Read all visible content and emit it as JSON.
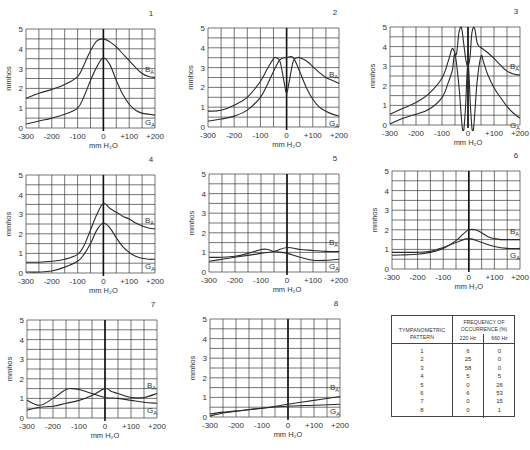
{
  "chart_data": [
    {
      "type": "line",
      "panel": "1",
      "xlabel": "mm H2O",
      "ylabel": "mmhos",
      "xlim": [
        -300,
        200
      ],
      "ylim": [
        0,
        5
      ],
      "xticks": [
        "-300",
        "-200",
        "-100",
        "0",
        "+100",
        "+200"
      ],
      "yticks": [
        "0",
        "1",
        "2",
        "3",
        "4",
        "5"
      ],
      "grid": true,
      "series": [
        {
          "name": "BA",
          "x": [
            -300,
            -250,
            -200,
            -150,
            -100,
            -75,
            -50,
            -25,
            0,
            25,
            50,
            75,
            100,
            125,
            150,
            175,
            200
          ],
          "y": [
            1.5,
            1.75,
            1.95,
            2.2,
            2.6,
            3.2,
            3.9,
            4.4,
            4.5,
            4.35,
            4.1,
            3.75,
            3.4,
            3.05,
            2.75,
            2.6,
            2.55
          ]
        },
        {
          "name": "GA",
          "x": [
            -300,
            -250,
            -200,
            -150,
            -100,
            -75,
            -50,
            -25,
            0,
            25,
            50,
            75,
            100,
            125,
            150,
            175,
            200
          ],
          "y": [
            0.2,
            0.35,
            0.5,
            0.7,
            1.0,
            1.6,
            2.4,
            3.1,
            3.55,
            3.2,
            2.4,
            1.7,
            1.2,
            0.9,
            0.75,
            0.7,
            0.65
          ]
        }
      ]
    },
    {
      "type": "line",
      "panel": "2",
      "xlabel": "mm H2O",
      "ylabel": "mmhos",
      "xlim": [
        -300,
        200
      ],
      "ylim": [
        0,
        5
      ],
      "xticks": [
        "-300",
        "-200",
        "-100",
        "0",
        "+100",
        "+200"
      ],
      "yticks": [
        "0",
        "1",
        "2",
        "3",
        "4",
        "5"
      ],
      "grid": true,
      "series": [
        {
          "name": "BA",
          "x": [
            -300,
            -250,
            -200,
            -150,
            -100,
            -75,
            -50,
            -40,
            -25,
            -10,
            0,
            10,
            25,
            40,
            50,
            75,
            100,
            125,
            150,
            175,
            200
          ],
          "y": [
            0.8,
            0.85,
            1.1,
            1.5,
            2.3,
            2.9,
            3.45,
            3.5,
            3.3,
            2.3,
            1.7,
            2.3,
            3.3,
            3.5,
            3.5,
            3.35,
            3.05,
            2.75,
            2.5,
            2.35,
            2.2
          ]
        },
        {
          "name": "GA",
          "x": [
            -300,
            -250,
            -200,
            -150,
            -100,
            -75,
            -50,
            -25,
            0,
            25,
            50,
            75,
            100,
            125,
            150,
            175,
            200
          ],
          "y": [
            0.3,
            0.4,
            0.55,
            0.85,
            1.5,
            2.1,
            2.8,
            3.4,
            3.5,
            3.5,
            2.8,
            2.0,
            1.4,
            1.0,
            0.8,
            0.65,
            0.55
          ]
        }
      ]
    },
    {
      "type": "line",
      "panel": "3",
      "xlabel": "mm H2O",
      "ylabel": "mmhos",
      "xlim": [
        -300,
        200
      ],
      "ylim": [
        0,
        5
      ],
      "xticks": [
        "-300",
        "-200",
        "-100",
        "0",
        "+100",
        "+200"
      ],
      "yticks": [
        "0",
        "1",
        "2",
        "3",
        "4",
        "5"
      ],
      "grid": true,
      "series": [
        {
          "name": "BA",
          "x": [
            -300,
            -250,
            -200,
            -150,
            -100,
            -75,
            -60,
            -45,
            -35,
            -25,
            -15,
            -8,
            0,
            8,
            15,
            25,
            35,
            45,
            60,
            75,
            100,
            125,
            150,
            175,
            200
          ],
          "y": [
            0.55,
            0.85,
            1.15,
            1.6,
            2.4,
            3.3,
            3.9,
            3.6,
            4.7,
            4.95,
            4.0,
            3.3,
            3.0,
            3.5,
            4.7,
            4.95,
            4.2,
            4.0,
            3.85,
            3.7,
            3.4,
            3.05,
            2.75,
            2.6,
            2.55
          ]
        },
        {
          "name": "GA",
          "x": [
            -300,
            -250,
            -200,
            -150,
            -100,
            -75,
            -60,
            -50,
            -35,
            -20,
            -10,
            0,
            10,
            20,
            35,
            50,
            60,
            75,
            100,
            125,
            150,
            175,
            200
          ],
          "y": [
            0.05,
            0.35,
            0.55,
            0.8,
            1.4,
            2.2,
            2.8,
            3.6,
            2.0,
            -0.3,
            0.8,
            3.3,
            0.8,
            -0.3,
            2.2,
            3.5,
            3.2,
            2.6,
            1.9,
            1.4,
            0.95,
            0.6,
            0.35
          ]
        }
      ]
    },
    {
      "type": "line",
      "panel": "4",
      "xlabel": "mm H2O",
      "ylabel": "mmhos",
      "xlim": [
        -300,
        200
      ],
      "ylim": [
        0,
        5
      ],
      "xticks": [
        "-300",
        "-200",
        "-100",
        "0",
        "+100",
        "+200"
      ],
      "yticks": [
        "0",
        "1",
        "2",
        "3",
        "4",
        "5"
      ],
      "grid": true,
      "series": [
        {
          "name": "BA",
          "x": [
            -300,
            -250,
            -200,
            -150,
            -100,
            -75,
            -50,
            -25,
            0,
            25,
            50,
            75,
            100,
            125,
            150,
            175,
            200
          ],
          "y": [
            0.55,
            0.55,
            0.6,
            0.7,
            0.95,
            1.4,
            2.2,
            3.0,
            3.55,
            3.3,
            3.1,
            2.9,
            2.75,
            2.55,
            2.4,
            2.3,
            2.25
          ]
        },
        {
          "name": "GA",
          "x": [
            -300,
            -250,
            -200,
            -150,
            -100,
            -75,
            -50,
            -25,
            0,
            25,
            50,
            75,
            100,
            125,
            150,
            175,
            200
          ],
          "y": [
            0.05,
            0.05,
            0.1,
            0.3,
            0.6,
            0.95,
            1.5,
            2.2,
            2.55,
            2.3,
            1.8,
            1.35,
            1.05,
            0.85,
            0.75,
            0.7,
            0.7
          ]
        }
      ]
    },
    {
      "type": "line",
      "panel": "5",
      "xlabel": "mm H2O",
      "ylabel": "mmhos",
      "xlim": [
        -300,
        200
      ],
      "ylim": [
        0,
        5
      ],
      "xticks": [
        "-300",
        "-200",
        "-100",
        "0",
        "+100",
        "+200"
      ],
      "yticks": [
        "0",
        "1",
        "2",
        "3",
        "4",
        "5"
      ],
      "grid": true,
      "series": [
        {
          "name": "BA",
          "x": [
            -300,
            -250,
            -200,
            -150,
            -100,
            -50,
            0,
            50,
            100,
            150,
            200
          ],
          "y": [
            0.55,
            0.65,
            0.75,
            0.85,
            0.95,
            1.05,
            1.25,
            1.15,
            1.1,
            1.05,
            1.05
          ]
        },
        {
          "name": "GA",
          "x": [
            -300,
            -250,
            -200,
            -150,
            -100,
            -75,
            -50,
            0,
            50,
            100,
            150,
            200
          ],
          "y": [
            0.75,
            0.75,
            0.8,
            0.95,
            1.15,
            1.15,
            1.05,
            0.95,
            0.75,
            0.6,
            0.6,
            0.65
          ]
        }
      ]
    },
    {
      "type": "line",
      "panel": "6",
      "xlabel": "mm H2O",
      "ylabel": "mmhos",
      "xlim": [
        -300,
        200
      ],
      "ylim": [
        0,
        5
      ],
      "xticks": [
        "-300",
        "-200",
        "-100",
        "0",
        "+100",
        "+200"
      ],
      "yticks": [
        "0",
        "1",
        "2",
        "3",
        "4",
        "5"
      ],
      "grid": true,
      "series": [
        {
          "name": "BA",
          "x": [
            -300,
            -250,
            -200,
            -150,
            -100,
            -50,
            -25,
            0,
            25,
            50,
            75,
            100,
            125,
            150,
            200
          ],
          "y": [
            0.7,
            0.72,
            0.75,
            0.85,
            1.05,
            1.45,
            1.75,
            2.0,
            2.0,
            1.85,
            1.65,
            1.55,
            1.5,
            1.5,
            1.5
          ]
        },
        {
          "name": "GA",
          "x": [
            -300,
            -250,
            -200,
            -150,
            -100,
            -50,
            0,
            50,
            100,
            150,
            200
          ],
          "y": [
            0.85,
            0.85,
            0.85,
            0.9,
            1.1,
            1.35,
            1.55,
            1.35,
            1.15,
            1.05,
            1.05
          ]
        }
      ]
    },
    {
      "type": "line",
      "panel": "7",
      "xlabel": "mm H2O",
      "ylabel": "mmhos",
      "xlim": [
        -300,
        200
      ],
      "ylim": [
        0,
        5
      ],
      "xticks": [
        "-300",
        "-200",
        "-100",
        "0",
        "+100",
        "+200"
      ],
      "yticks": [
        "0",
        "1",
        "2",
        "3",
        "4",
        "5"
      ],
      "grid": true,
      "series": [
        {
          "name": "BA",
          "x": [
            -300,
            -250,
            -200,
            -150,
            -100,
            -50,
            0,
            25,
            50,
            100,
            150,
            200
          ],
          "y": [
            0.4,
            0.55,
            0.6,
            0.75,
            0.9,
            1.15,
            1.5,
            1.35,
            1.25,
            1.05,
            1.05,
            1.25
          ]
        },
        {
          "name": "GA",
          "x": [
            -300,
            -250,
            -200,
            -150,
            -125,
            -100,
            -50,
            0,
            50,
            100,
            150,
            200
          ],
          "y": [
            0.9,
            0.65,
            1.0,
            1.45,
            1.5,
            1.45,
            1.25,
            1.05,
            1.0,
            0.9,
            0.8,
            0.75
          ]
        }
      ]
    },
    {
      "type": "line",
      "panel": "8",
      "xlabel": "mm H2O",
      "ylabel": "mmhos",
      "xlim": [
        -300,
        200
      ],
      "ylim": [
        0,
        5
      ],
      "xticks": [
        "-300",
        "-200",
        "-100",
        "0",
        "+100",
        "+200"
      ],
      "yticks": [
        "0",
        "1",
        "2",
        "3",
        "4",
        "5"
      ],
      "grid": true,
      "series": [
        {
          "name": "BA",
          "x": [
            -300,
            -250,
            -200,
            -100,
            0,
            100,
            200
          ],
          "y": [
            0.05,
            0.2,
            0.3,
            0.45,
            0.65,
            0.85,
            1.05
          ]
        },
        {
          "name": "GA",
          "x": [
            -300,
            -250,
            -200,
            -100,
            0,
            100,
            200
          ],
          "y": [
            0.15,
            0.25,
            0.3,
            0.45,
            0.55,
            0.6,
            0.65
          ]
        }
      ]
    },
    {
      "type": "table",
      "title": "Frequency of occurrence (%) by tympanometric pattern",
      "columns": [
        "TYMPANOMETRIC PATTERN",
        "220 Hz",
        "660 Hz"
      ],
      "rows": [
        [
          "1",
          "6",
          "0"
        ],
        [
          "2",
          "25",
          "0"
        ],
        [
          "3",
          "58",
          "0"
        ],
        [
          "4",
          "5",
          "5"
        ],
        [
          "5",
          "0",
          "26"
        ],
        [
          "6",
          "6",
          "53"
        ],
        [
          "7",
          "0",
          "15"
        ],
        [
          "8",
          "0",
          "1"
        ]
      ]
    }
  ],
  "panels": [
    {
      "number": "1",
      "plot": {
        "x": 26,
        "y": 29,
        "w": 129,
        "h": 99
      }
    },
    {
      "number": "2",
      "plot": {
        "x": 208,
        "y": 28,
        "w": 131,
        "h": 99
      }
    },
    {
      "number": "3",
      "plot": {
        "x": 390,
        "y": 27,
        "w": 130,
        "h": 98
      }
    },
    {
      "number": "4",
      "plot": {
        "x": 26,
        "y": 175,
        "w": 129,
        "h": 98
      }
    },
    {
      "number": "5",
      "plot": {
        "x": 209,
        "y": 174,
        "w": 130,
        "h": 98
      }
    },
    {
      "number": "6",
      "plot": {
        "x": 392,
        "y": 171,
        "w": 128,
        "h": 98
      }
    },
    {
      "number": "7",
      "plot": {
        "x": 27,
        "y": 320,
        "w": 130,
        "h": 98
      }
    },
    {
      "number": "8",
      "plot": {
        "x": 210,
        "y": 319,
        "w": 130,
        "h": 98
      }
    }
  ],
  "labels": {
    "y_axis": "mmhos",
    "x_axis": "mm H₂O",
    "series_b": "B",
    "series_g": "G",
    "subscript": "A"
  },
  "table": {
    "header_left_line1": "TYMPANOMETRIC",
    "header_left_line2": "PATTERN",
    "header_right_line1": "FREQUENCY OF",
    "header_right_line2": "OCCURRENCE (%)",
    "col_220": "220 Hz",
    "col_660": "660 Hz",
    "rows": [
      {
        "pattern": "1",
        "f220": "6",
        "f660": "0"
      },
      {
        "pattern": "2",
        "f220": "25",
        "f660": "0"
      },
      {
        "pattern": "3",
        "f220": "58",
        "f660": "0"
      },
      {
        "pattern": "4",
        "f220": "5",
        "f660": "5"
      },
      {
        "pattern": "5",
        "f220": "0",
        "f660": "26"
      },
      {
        "pattern": "6",
        "f220": "6",
        "f660": "53"
      },
      {
        "pattern": "7",
        "f220": "0",
        "f660": "15"
      },
      {
        "pattern": "8",
        "f220": "0",
        "f660": "1"
      }
    ]
  },
  "colors": {
    "line": "#2a2a2a",
    "grid": "#3a3a3a",
    "zero_axis": "#111111",
    "text": "#333333"
  }
}
